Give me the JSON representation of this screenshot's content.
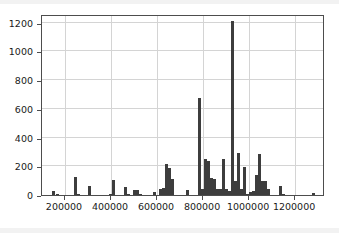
{
  "chart_data": {
    "type": "bar",
    "title": "",
    "xlabel": "",
    "ylabel": "",
    "xlim": [
      100000,
      1330000
    ],
    "ylim": [
      0,
      1260
    ],
    "grid": true,
    "legend": null,
    "bar_color": "#3d3d3d",
    "background_color": "#ffffff",
    "axis_color": "#4d4d4d",
    "grid_color": "#d4d4d4",
    "yticks": [
      0,
      200,
      400,
      600,
      800,
      1000,
      1200
    ],
    "ytick_labels": [
      "0",
      "200",
      "400",
      "600",
      "800",
      "1000",
      "1200"
    ],
    "xticks": [
      200000,
      400000,
      600000,
      800000,
      1000000,
      1200000
    ],
    "xtick_labels": [
      "200000",
      "400000",
      "600000",
      "800000",
      "1000000",
      "1200000"
    ],
    "bin_width": 13000,
    "x": [
      148000,
      168000,
      246000,
      259000,
      305000,
      396000,
      409000,
      461000,
      474000,
      500000,
      513000,
      526000,
      591000,
      617000,
      630000,
      643000,
      656000,
      669000,
      734000,
      786000,
      799000,
      812000,
      825000,
      838000,
      851000,
      864000,
      877000,
      890000,
      903000,
      916000,
      929000,
      942000,
      955000,
      968000,
      981000,
      994000,
      1007000,
      1020000,
      1033000,
      1046000,
      1059000,
      1072000,
      1085000,
      1137000,
      1150000,
      1280000
    ],
    "values": [
      30,
      5,
      125,
      5,
      65,
      8,
      105,
      55,
      5,
      38,
      36,
      5,
      22,
      45,
      50,
      215,
      190,
      112,
      38,
      675,
      40,
      250,
      235,
      120,
      110,
      40,
      45,
      250,
      45,
      30,
      1208,
      100,
      292,
      45,
      195,
      8,
      18,
      30,
      140,
      285,
      100,
      100,
      45,
      62,
      5,
      12
    ],
    "peaks": [
      {
        "x": 929000,
        "value": 1208,
        "note": "tallest bar"
      },
      {
        "x": 786000,
        "value": 675,
        "note": "second tallest"
      },
      {
        "x": 955000,
        "value": 292,
        "note": "third"
      },
      {
        "x": 1046000,
        "value": 285
      },
      {
        "x": 812000,
        "value": 250
      },
      {
        "x": 890000,
        "value": 250
      },
      {
        "x": 825000,
        "value": 235
      },
      {
        "x": 643000,
        "value": 215
      },
      {
        "x": 981000,
        "value": 195
      }
    ]
  }
}
